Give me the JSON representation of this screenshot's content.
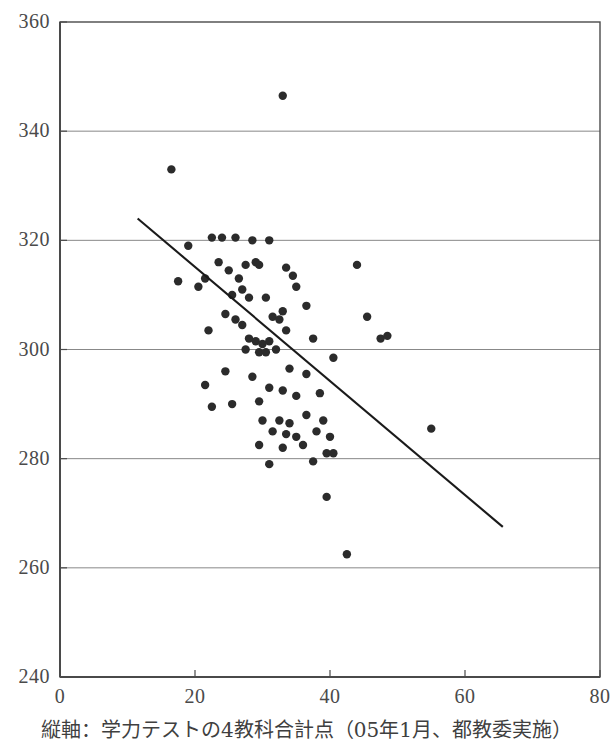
{
  "caption": "縦軸：学力テストの4教科合計点（05年1月、都教委実施）",
  "chart_data": {
    "type": "scatter",
    "title": "",
    "xlabel": "",
    "ylabel": "",
    "xlim": [
      0,
      80
    ],
    "ylim": [
      240,
      360
    ],
    "xticks": [
      0,
      20,
      40,
      60,
      80
    ],
    "yticks": [
      240,
      260,
      280,
      300,
      320,
      340,
      360
    ],
    "xtick_labels": [
      "0",
      "20",
      "40",
      "60",
      "80"
    ],
    "ytick_labels": [
      "240",
      "260",
      "280",
      "300",
      "320",
      "340",
      "360"
    ],
    "grid": "horizontal",
    "grid_color": "#888888",
    "frame_color": "#4a4a4a",
    "point_color": "#2b2b2b",
    "point_radius": 4.2,
    "trendline": {
      "x0": 11.5,
      "y0": 324.0,
      "x1": 65.6,
      "y1": 267.5,
      "color": "#1a1a1a",
      "width": 2.1
    },
    "points": [
      [
        33.0,
        346.5
      ],
      [
        16.5,
        333.0
      ],
      [
        19.0,
        319.0
      ],
      [
        17.5,
        312.5
      ],
      [
        22.5,
        320.5
      ],
      [
        24.0,
        320.5
      ],
      [
        26.0,
        320.5
      ],
      [
        28.5,
        320.0
      ],
      [
        31.0,
        320.0
      ],
      [
        21.5,
        313.0
      ],
      [
        20.5,
        311.5
      ],
      [
        23.5,
        316.0
      ],
      [
        25.0,
        314.5
      ],
      [
        26.5,
        313.0
      ],
      [
        27.5,
        315.5
      ],
      [
        29.0,
        316.0
      ],
      [
        29.5,
        315.5
      ],
      [
        33.5,
        315.0
      ],
      [
        34.5,
        313.5
      ],
      [
        44.0,
        315.5
      ],
      [
        27.0,
        311.0
      ],
      [
        28.0,
        309.5
      ],
      [
        25.5,
        310.0
      ],
      [
        24.5,
        306.5
      ],
      [
        30.5,
        309.5
      ],
      [
        35.0,
        311.5
      ],
      [
        22.0,
        303.5
      ],
      [
        26.0,
        305.5
      ],
      [
        27.0,
        304.5
      ],
      [
        31.5,
        306.0
      ],
      [
        32.5,
        305.5
      ],
      [
        33.0,
        307.0
      ],
      [
        36.5,
        308.0
      ],
      [
        45.5,
        306.0
      ],
      [
        28.0,
        302.0
      ],
      [
        29.0,
        301.5
      ],
      [
        30.0,
        301.0
      ],
      [
        31.0,
        301.5
      ],
      [
        33.5,
        303.5
      ],
      [
        37.5,
        302.0
      ],
      [
        47.5,
        302.0
      ],
      [
        48.5,
        302.5
      ],
      [
        27.5,
        300.0
      ],
      [
        29.5,
        299.5
      ],
      [
        30.5,
        299.5
      ],
      [
        32.0,
        300.0
      ],
      [
        40.5,
        298.5
      ],
      [
        24.5,
        296.0
      ],
      [
        34.0,
        296.5
      ],
      [
        36.5,
        295.5
      ],
      [
        21.5,
        293.5
      ],
      [
        28.5,
        295.0
      ],
      [
        31.0,
        293.0
      ],
      [
        22.5,
        289.5
      ],
      [
        25.5,
        290.0
      ],
      [
        29.5,
        290.5
      ],
      [
        33.0,
        292.5
      ],
      [
        35.0,
        291.5
      ],
      [
        38.5,
        292.0
      ],
      [
        55.0,
        285.5
      ],
      [
        30.0,
        287.0
      ],
      [
        32.5,
        287.0
      ],
      [
        34.0,
        286.5
      ],
      [
        36.5,
        288.0
      ],
      [
        39.0,
        287.0
      ],
      [
        31.5,
        285.0
      ],
      [
        33.5,
        284.5
      ],
      [
        35.0,
        284.0
      ],
      [
        38.0,
        285.0
      ],
      [
        40.0,
        284.0
      ],
      [
        29.5,
        282.5
      ],
      [
        33.0,
        282.0
      ],
      [
        36.0,
        282.5
      ],
      [
        39.5,
        281.0
      ],
      [
        40.5,
        281.0
      ],
      [
        31.0,
        279.0
      ],
      [
        37.5,
        279.5
      ],
      [
        39.5,
        273.0
      ],
      [
        42.5,
        262.5
      ]
    ]
  }
}
